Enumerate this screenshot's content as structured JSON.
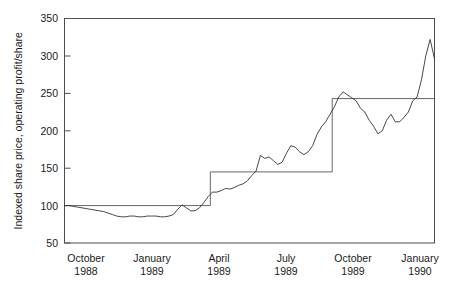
{
  "chart_data": {
    "type": "line",
    "title": "",
    "subtitle": "",
    "xlabel": "",
    "ylabel": "Indexed share price, operating profit/share",
    "ylim": [
      50,
      350
    ],
    "yticks": [
      50,
      100,
      150,
      200,
      250,
      300,
      350
    ],
    "ytick_labels": [
      "50",
      "100",
      "150",
      "200",
      "250",
      "300",
      "350"
    ],
    "grid": false,
    "legend": "none",
    "xlim": [
      "1988-09-01",
      "1990-02-15"
    ],
    "xtick_labels": [
      {
        "month": "October",
        "year": "1988"
      },
      {
        "month": "January",
        "year": "1989"
      },
      {
        "month": "April",
        "year": "1989"
      },
      {
        "month": "July",
        "year": "1989"
      },
      {
        "month": "October",
        "year": "1989"
      },
      {
        "month": "January",
        "year": "1990"
      }
    ],
    "xtick_positions_months": [
      1,
      4,
      7,
      10,
      13,
      16
    ],
    "colors": {
      "share_price_line": "#333333",
      "operating_profit_step": "#555555",
      "frame": "#4d4d4d",
      "background": "#ffffff",
      "text": "#1a1a1a"
    },
    "series": [
      {
        "name": "Indexed share price",
        "type": "line",
        "x": [
          0.0,
          0.2,
          0.4,
          0.6,
          0.8,
          1.0,
          1.2,
          1.4,
          1.6,
          1.8,
          2.0,
          2.2,
          2.4,
          2.6,
          2.8,
          3.0,
          3.2,
          3.4,
          3.6,
          3.8,
          4.0,
          4.2,
          4.4,
          4.6,
          4.8,
          5.0,
          5.2,
          5.4,
          5.6,
          5.8,
          6.0,
          6.2,
          6.4,
          6.6,
          6.8,
          7.0,
          7.2,
          7.4,
          7.6,
          7.8,
          8.0,
          8.2,
          8.4,
          8.6,
          8.8,
          9.0,
          9.2,
          9.4,
          9.6,
          9.8,
          10.0,
          10.2,
          10.4,
          10.6,
          10.8,
          11.0,
          11.2,
          11.4,
          11.6,
          11.8,
          12.0,
          12.2,
          12.4,
          12.6,
          12.8,
          13.0,
          13.2,
          13.4,
          13.6,
          13.8,
          14.0,
          14.2,
          14.4,
          14.6,
          14.8,
          15.0,
          15.2,
          15.4,
          15.6,
          15.8,
          16.0,
          16.2,
          16.4,
          16.6,
          16.8,
          17.0
        ],
        "y": [
          100,
          100,
          99,
          98,
          97,
          96,
          95,
          94,
          93,
          92,
          90,
          88,
          86,
          85,
          85,
          86,
          86,
          85,
          85,
          86,
          86,
          86,
          85,
          85,
          86,
          88,
          95,
          101,
          97,
          93,
          93,
          97,
          104,
          112,
          118,
          118,
          120,
          123,
          122,
          124,
          127,
          129,
          133,
          140,
          146,
          167,
          163,
          165,
          160,
          155,
          158,
          170,
          180,
          178,
          172,
          168,
          172,
          180,
          195,
          205,
          212,
          222,
          232,
          245,
          252,
          248,
          244,
          240,
          230,
          225,
          214,
          206,
          196,
          200,
          214,
          222,
          212,
          212,
          218,
          225,
          240,
          245,
          268,
          300,
          322,
          296
        ],
        "x_unit": "months since September 1988",
        "value_at_start": 100,
        "value_at_end": 296,
        "min_value": 85,
        "max_value": 322
      },
      {
        "name": "Operating profit/share",
        "type": "step",
        "steps": [
          {
            "from_month": 0.0,
            "to_month": 6.7,
            "value": 100
          },
          {
            "from_month": 6.7,
            "to_month": 12.3,
            "value": 145
          },
          {
            "from_month": 12.3,
            "to_month": 17.0,
            "value": 243
          }
        ],
        "value_at_start": 100,
        "value_at_end": 243
      }
    ]
  }
}
